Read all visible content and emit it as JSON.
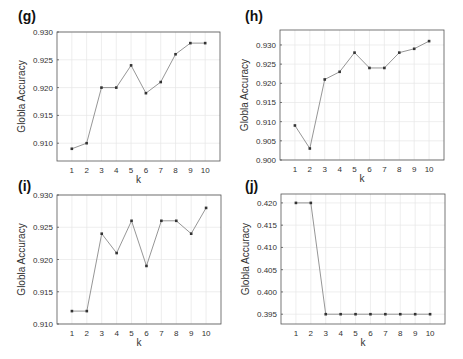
{
  "chart_data": [
    {
      "panel": "(g)",
      "type": "line",
      "xlabel": "k",
      "ylabel": "Globla Accuracy",
      "x": [
        1,
        2,
        3,
        4,
        5,
        6,
        7,
        8,
        9,
        10
      ],
      "values": [
        0.909,
        0.91,
        0.92,
        0.92,
        0.924,
        0.919,
        0.921,
        0.926,
        0.928,
        0.928
      ],
      "yticks": [
        0.91,
        0.915,
        0.92,
        0.925,
        0.93
      ],
      "ytick_labels": [
        "0.910",
        "0.915",
        "0.920",
        "0.925",
        "0.930"
      ],
      "ylim": [
        0.9068,
        0.93
      ],
      "xlim": [
        0,
        11
      ],
      "grid": true,
      "box": {
        "left": 57,
        "top": 32,
        "right": 220,
        "bottom": 161
      },
      "label_pos": {
        "x": 18,
        "y": 8
      }
    },
    {
      "panel": "(h)",
      "type": "line",
      "xlabel": "k",
      "ylabel": "Globla Accuracy",
      "x": [
        1,
        2,
        3,
        4,
        5,
        6,
        7,
        8,
        9,
        10
      ],
      "values": [
        0.909,
        0.903,
        0.921,
        0.923,
        0.928,
        0.924,
        0.924,
        0.928,
        0.929,
        0.931
      ],
      "yticks": [
        0.9,
        0.905,
        0.91,
        0.915,
        0.92,
        0.925,
        0.93
      ],
      "ytick_labels": [
        "0.900",
        "0.905",
        "0.910",
        "0.915",
        "0.920",
        "0.925",
        "0.930"
      ],
      "ylim": [
        0.9,
        0.9339
      ],
      "xlim": [
        0,
        11
      ],
      "grid": true,
      "box": {
        "left": 280,
        "top": 30,
        "right": 444,
        "bottom": 160
      },
      "label_pos": {
        "x": 245,
        "y": 8
      }
    },
    {
      "panel": "(i)",
      "type": "line",
      "xlabel": "k",
      "ylabel": "Globla Accuracy",
      "x": [
        1,
        2,
        3,
        4,
        5,
        6,
        7,
        8,
        9,
        10
      ],
      "values": [
        0.912,
        0.912,
        0.924,
        0.921,
        0.926,
        0.919,
        0.926,
        0.926,
        0.924,
        0.928
      ],
      "yticks": [
        0.91,
        0.915,
        0.92,
        0.925,
        0.93
      ],
      "ytick_labels": [
        "0.910",
        "0.915",
        "0.920",
        "0.925",
        "0.930"
      ],
      "ylim": [
        0.91,
        0.93
      ],
      "xlim": [
        0,
        11
      ],
      "grid": true,
      "box": {
        "left": 57,
        "top": 195,
        "right": 221,
        "bottom": 324
      },
      "label_pos": {
        "x": 18,
        "y": 178
      }
    },
    {
      "panel": "(j)",
      "type": "line",
      "xlabel": "k",
      "ylabel": "Globla Accuracy",
      "x": [
        1,
        2,
        3,
        4,
        5,
        6,
        7,
        8,
        9,
        10
      ],
      "values": [
        0.42,
        0.42,
        0.395,
        0.395,
        0.395,
        0.395,
        0.395,
        0.395,
        0.395,
        0.395
      ],
      "yticks": [
        0.395,
        0.4,
        0.405,
        0.41,
        0.415,
        0.42
      ],
      "ytick_labels": [
        "0.395",
        "0.400",
        "0.405",
        "0.410",
        "0.415",
        "0.420"
      ],
      "ylim": [
        0.3928,
        0.422
      ],
      "xlim": [
        0,
        11
      ],
      "grid": true,
      "box": {
        "left": 281,
        "top": 194,
        "right": 445,
        "bottom": 324
      },
      "label_pos": {
        "x": 245,
        "y": 178
      }
    }
  ],
  "colors": {
    "line": "#8a8a8a",
    "marker": "#333333",
    "axis": "#555555",
    "grid": "#e6e6e6",
    "text": "#333333"
  }
}
